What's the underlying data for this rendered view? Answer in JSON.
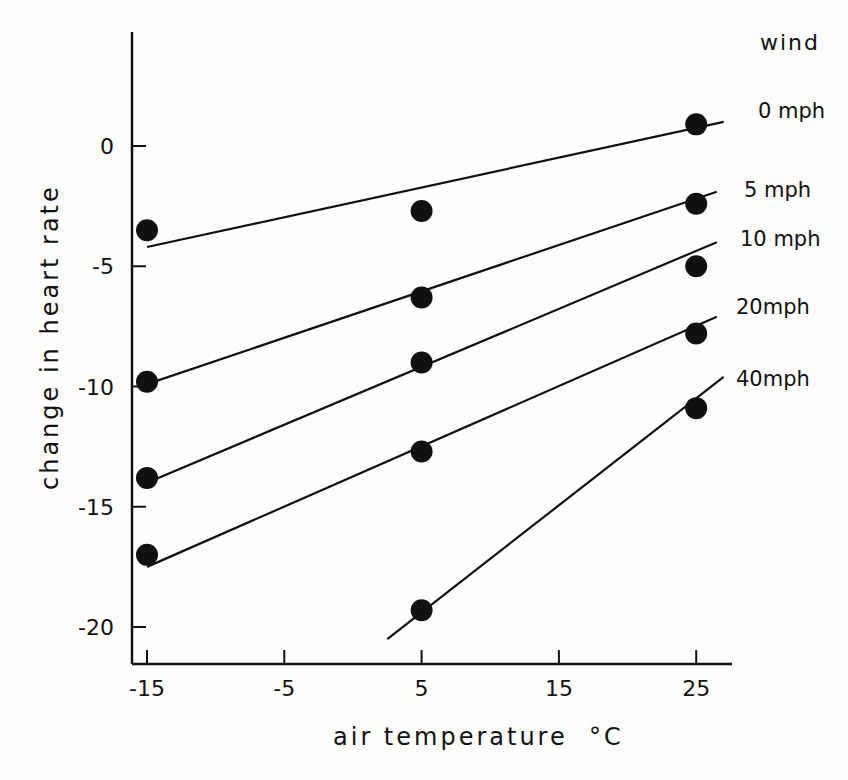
{
  "chart_data": {
    "type": "scatter",
    "title": "",
    "xlabel": "air temperature  °C",
    "ylabel": "change in heart rate",
    "xlim": [
      -16,
      28
    ],
    "ylim": [
      -21.5,
      5
    ],
    "xticks": [
      -15,
      -5,
      5,
      15,
      25
    ],
    "yticks": [
      0,
      -5,
      -10,
      -15,
      -20
    ],
    "xtick_labels": [
      "-15",
      "-5",
      "5",
      "15",
      "25"
    ],
    "ytick_labels": [
      "0",
      "-5",
      "-10",
      "-15",
      "-20"
    ],
    "grid": false,
    "legend_title": "wind",
    "legend_position": "right, labels at line ends",
    "series": [
      {
        "name": "0 mph",
        "x": [
          -15,
          5,
          25
        ],
        "values": [
          -3.5,
          -2.7,
          0.9
        ],
        "fit_line": [
          [
            -15,
            -4.2
          ],
          [
            27,
            1.0
          ]
        ]
      },
      {
        "name": "5 mph",
        "x": [
          -15,
          5,
          25
        ],
        "values": [
          -9.8,
          -6.3,
          -2.4
        ],
        "fit_line": [
          [
            -15,
            -9.9
          ],
          [
            26.5,
            -1.9
          ]
        ]
      },
      {
        "name": "10 mph",
        "x": [
          -15,
          5,
          25
        ],
        "values": [
          -13.8,
          -9.0,
          -5.0
        ],
        "fit_line": [
          [
            -15,
            -14.0
          ],
          [
            26.5,
            -4.0
          ]
        ]
      },
      {
        "name": "20mph",
        "x": [
          -15,
          5,
          25
        ],
        "values": [
          -17.0,
          -12.7,
          -7.8
        ],
        "fit_line": [
          [
            -15,
            -17.5
          ],
          [
            26.5,
            -7.1
          ]
        ]
      },
      {
        "name": "40mph",
        "x": [
          5,
          25
        ],
        "values": [
          -19.3,
          -10.9
        ],
        "fit_line": [
          [
            2.5,
            -20.5
          ],
          [
            27,
            -9.6
          ]
        ]
      }
    ]
  }
}
